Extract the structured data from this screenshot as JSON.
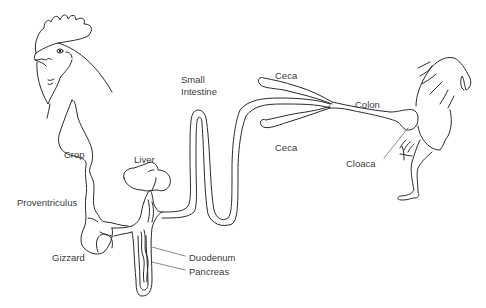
{
  "diagram": {
    "labels": [
      {
        "id": "small_intestine",
        "text": "Small\nIntestine",
        "line1": "Small",
        "line2": "Intestine"
      },
      {
        "id": "ceca_top",
        "text": "Ceca"
      },
      {
        "id": "colon",
        "text": "Colon"
      },
      {
        "id": "ceca_bottom",
        "text": "Ceca"
      },
      {
        "id": "cloaca",
        "text": "Cloaca"
      },
      {
        "id": "crop",
        "text": "Crop"
      },
      {
        "id": "liver",
        "text": "Liver"
      },
      {
        "id": "proventriculus",
        "text": "Proventriculus"
      },
      {
        "id": "gizzard",
        "text": "Gizzard"
      },
      {
        "id": "duodenum",
        "text": "Duodenum"
      },
      {
        "id": "pancreas",
        "text": "Pancreas"
      }
    ],
    "colors": {
      "line": "#2a2a2a",
      "label_text": "#3a3a3a",
      "background": "#ffffff"
    }
  }
}
